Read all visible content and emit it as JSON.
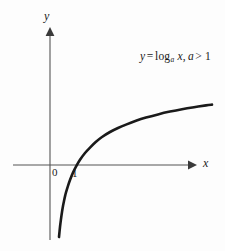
{
  "figure": {
    "width": 225,
    "height": 251,
    "background_color": "#fdfdfd",
    "ink_color": "#1a1a1a",
    "axis_color": "#555555"
  },
  "annotations": {
    "equation": {
      "lhs": "y",
      "equals": "=",
      "function": "log",
      "base": "a",
      "argument": "x",
      "comma": ",",
      "condition_var": "a",
      "condition_op": ">",
      "condition_value": "1",
      "full_text": "y = log_a x, a > 1"
    }
  },
  "axes": {
    "x_label": "x",
    "y_label": "y",
    "x_axis": {
      "y_px": 165,
      "start_px": 13,
      "end_px": 196,
      "arrow": "right"
    },
    "y_axis": {
      "x_px": 50,
      "start_px": 240,
      "end_px": 28,
      "arrow": "up"
    },
    "tick_labels": [
      {
        "text": "0",
        "x_px": 52,
        "y_px": 167
      },
      {
        "text": "1",
        "x_px": 72,
        "y_px": 168
      }
    ]
  },
  "chart_data": {
    "type": "line",
    "title": "",
    "subtitle": "",
    "xlabel": "x",
    "ylabel": "y",
    "grid": false,
    "legend": null,
    "annotations": [
      "y = log_a x, a > 1"
    ],
    "axis_origin_px": {
      "x": 50,
      "y": 165
    },
    "px_per_unit": {
      "x": 20,
      "y": 20
    },
    "xlim": [
      0,
      8.75
    ],
    "ylim": [
      -3.85,
      3.85
    ],
    "series": [
      {
        "name": "y = log_a x, a > 1",
        "color": "#1a1a1a",
        "line_width_px": 2.6,
        "x": [
          0.45,
          0.5,
          0.55,
          0.6,
          0.65,
          0.7,
          0.75,
          0.8,
          0.9,
          1.0,
          1.15,
          1.3,
          1.5,
          1.75,
          2.0,
          2.3,
          2.6,
          3.0,
          3.4,
          3.8,
          4.3,
          4.8,
          5.4,
          6.0,
          6.6,
          7.2,
          7.8,
          8.1
        ],
        "y": [
          -3.6,
          -3.1,
          -2.7,
          -2.35,
          -2.05,
          -1.8,
          -1.57,
          -1.37,
          -1.04,
          -0.75,
          -0.38,
          -0.08,
          0.26,
          0.6,
          0.87,
          1.16,
          1.4,
          1.65,
          1.85,
          2.02,
          2.21,
          2.37,
          2.53,
          2.67,
          2.79,
          2.89,
          2.98,
          3.02
        ],
        "points_px": [
          [
            59.0,
            237.0
          ],
          [
            60.0,
            227.0
          ],
          [
            61.0,
            219.0
          ],
          [
            62.0,
            212.0
          ],
          [
            63.0,
            206.0
          ],
          [
            64.0,
            201.0
          ],
          [
            65.0,
            196.4
          ],
          [
            66.0,
            192.4
          ],
          [
            68.0,
            185.8
          ],
          [
            70.0,
            180.0
          ],
          [
            73.0,
            172.6
          ],
          [
            76.0,
            166.6
          ],
          [
            80.0,
            159.8
          ],
          [
            85.0,
            153.0
          ],
          [
            90.0,
            147.6
          ],
          [
            96.0,
            141.8
          ],
          [
            102.0,
            137.0
          ],
          [
            110.0,
            132.0
          ],
          [
            118.0,
            128.0
          ],
          [
            126.0,
            124.6
          ],
          [
            136.0,
            120.8
          ],
          [
            146.0,
            117.6
          ],
          [
            158.0,
            114.4
          ],
          [
            170.0,
            111.6
          ],
          [
            182.0,
            109.2
          ],
          [
            194.0,
            107.2
          ],
          [
            206.0,
            105.4
          ],
          [
            212.0,
            104.6
          ]
        ],
        "crosses_x_axis_at": 1.0,
        "asymptote": "x = 0"
      }
    ]
  }
}
